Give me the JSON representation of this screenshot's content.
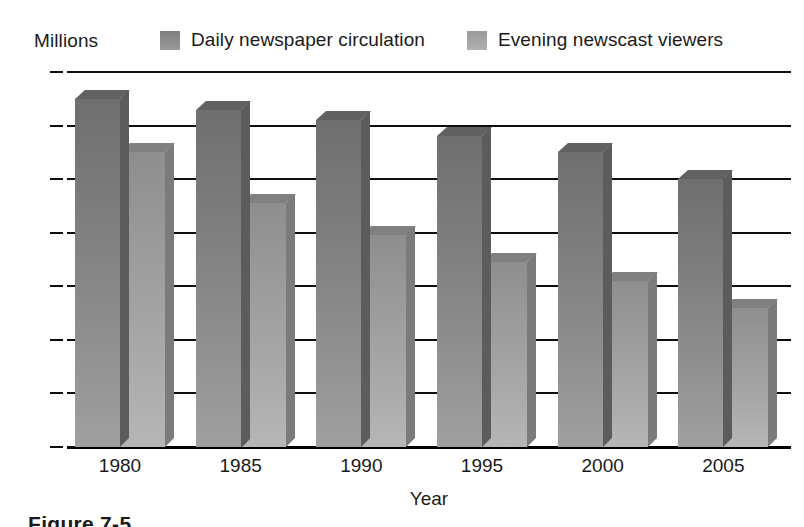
{
  "chart_data": {
    "type": "bar",
    "title": "",
    "subtitle": "",
    "units_label": "Millions",
    "xlabel": "Year",
    "ylabel": "",
    "categories": [
      "1980",
      "1985",
      "1990",
      "1995",
      "2000",
      "2005"
    ],
    "series": [
      {
        "name": "Daily newspaper circulation",
        "color": "#7c7c7c",
        "values": [
          65,
          63,
          61,
          58,
          55,
          50
        ]
      },
      {
        "name": "Evening newscast viewers",
        "color": "#a0a0a0",
        "values": [
          55,
          45.5,
          39.5,
          34.5,
          31,
          26
        ]
      }
    ],
    "ylim": [
      0,
      70
    ],
    "yticks": [
      0,
      10,
      20,
      30,
      40,
      50,
      60,
      70
    ],
    "ytick_labels": [
      "0",
      "10",
      "20",
      "30",
      "40",
      "50",
      "60",
      "70"
    ],
    "grid": true,
    "grid_axis": "y",
    "legend_position": "top",
    "style": "3d-bar-grayscale-scan"
  },
  "legend": {
    "items": [
      {
        "label": "Daily newspaper circulation",
        "swatch": "legend-swatch-series-1"
      },
      {
        "label": "Evening newscast viewers",
        "swatch": "legend-swatch-series-2"
      }
    ]
  },
  "caption": {
    "text": "Figure 7-5"
  }
}
